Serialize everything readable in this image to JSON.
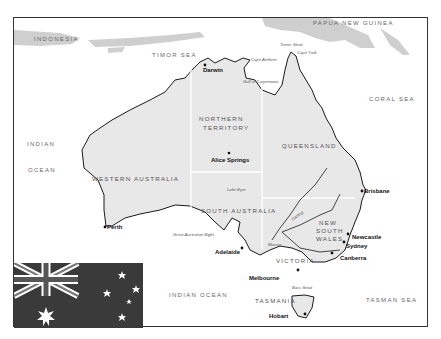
{
  "map": {
    "title": "Australia",
    "countries": [
      "INDONESIA",
      "PAPUA NEW GUINEA"
    ],
    "seas": {
      "timor": "TIMOR SEA",
      "coral": "CORAL SEA",
      "indian_ocean_w1": "INDIAN",
      "indian_ocean_w2": "OCEAN",
      "indian_ocean_s": "INDIAN OCEAN",
      "tasman": "TASMAN SEA"
    },
    "regions": {
      "nt1": "NORTHERN",
      "nt2": "TERRITORY",
      "qld": "QUEENSLAND",
      "wa": "WESTERN AUSTRALIA",
      "sa": "SOUTH AUSTRALIA",
      "nsw1": "NEW",
      "nsw2": "SOUTH",
      "nsw3": "WALES",
      "vic": "VICTORIA",
      "tas": "TASMANIA"
    },
    "cities": {
      "darwin": "Darwin",
      "alice": "Alice Springs",
      "brisbane": "Brisbane",
      "perth": "Perth",
      "adelaide": "Adelaide",
      "melbourne": "Melbourne",
      "newcastle": "Newcastle",
      "sydney": "Sydney",
      "canberra": "Canberra",
      "hobart": "Hobart"
    },
    "features": {
      "torres": "Torres Strait",
      "capeyork": "Cape York",
      "arnhem": "Cape Arnhem",
      "carpentaria": "Gulf of Carpentaria",
      "eyre": "Lake Eyre",
      "bight": "Great Australian Bight",
      "darling": "Darling",
      "murray": "Murray",
      "bass": "Bass Strait"
    },
    "colors": {
      "land": "#e8e8e8",
      "neighbour": "#cfcfcf",
      "coast": "#1a1a1a",
      "border": "#ffffff",
      "flag_field": "#3a3a3a"
    },
    "flag": {
      "name": "Australian flag"
    }
  }
}
